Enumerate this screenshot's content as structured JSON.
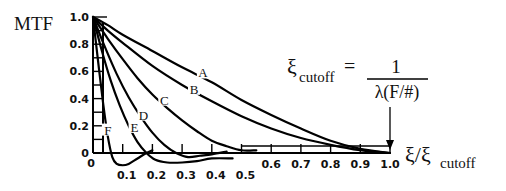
{
  "chart_data": {
    "type": "line",
    "title": "",
    "ylabel": "MTF",
    "xlabel_main": "ξ/ξ",
    "xlabel_sub": "cutoff",
    "xlim": [
      0,
      1.0
    ],
    "ylim": [
      -0.1,
      1.0
    ],
    "grid": false,
    "legend": "inline curve labels",
    "y_ticks": [
      0.2,
      0.4,
      0.6,
      0.8,
      1.0
    ],
    "y_tick_labels": [
      "0.2",
      "0.4",
      "0.6",
      "0.8",
      "1.0"
    ],
    "y_zero_label": "0",
    "x_origin_label": "0",
    "x_ticks_low": [
      0.1,
      0.2,
      0.3,
      0.4,
      0.5
    ],
    "x_tick_labels_low": [
      "0.1",
      "0.2",
      "0.3",
      "0.4",
      "0.5"
    ],
    "x_ticks_high": [
      0.6,
      0.7,
      0.8,
      0.9,
      1.0
    ],
    "x_tick_labels_high": [
      "0.6",
      "0.7",
      "0.8",
      "0.9",
      "1.0"
    ],
    "annotation": {
      "lhs_symbol": "ξ",
      "lhs_sub": "cutoff",
      "equals": "=",
      "numerator": "1",
      "denominator": "λ(F/#)",
      "arrow_target_x": 1.0
    },
    "series": [
      {
        "name": "A",
        "label_at": [
          0.37,
          0.57
        ],
        "x": [
          0,
          0.05,
          0.1,
          0.2,
          0.3,
          0.4,
          0.5,
          0.6,
          0.7,
          0.8,
          0.9,
          1.0
        ],
        "y": [
          1.0,
          0.94,
          0.87,
          0.75,
          0.63,
          0.52,
          0.39,
          0.28,
          0.18,
          0.09,
          0.03,
          0.0
        ]
      },
      {
        "name": "B",
        "label_at": [
          0.34,
          0.45
        ],
        "x": [
          0,
          0.05,
          0.1,
          0.2,
          0.3,
          0.4,
          0.5,
          0.6,
          0.7,
          0.8,
          0.9,
          0.95,
          1.0
        ],
        "y": [
          1.0,
          0.9,
          0.81,
          0.64,
          0.5,
          0.38,
          0.27,
          0.18,
          0.11,
          0.06,
          0.02,
          0.01,
          0.0
        ]
      },
      {
        "name": "C",
        "label_at": [
          0.24,
          0.37
        ],
        "x": [
          0,
          0.05,
          0.1,
          0.15,
          0.2,
          0.25,
          0.3,
          0.35,
          0.4,
          0.45,
          0.5,
          0.55
        ],
        "y": [
          1.0,
          0.84,
          0.69,
          0.55,
          0.43,
          0.33,
          0.24,
          0.16,
          0.09,
          0.05,
          0.02,
          0.02
        ]
      },
      {
        "name": "D",
        "label_at": [
          0.17,
          0.26
        ],
        "x": [
          0,
          0.04,
          0.08,
          0.12,
          0.16,
          0.2,
          0.24,
          0.28,
          0.32,
          0.36,
          0.4,
          0.45
        ],
        "y": [
          1.0,
          0.78,
          0.58,
          0.41,
          0.27,
          0.15,
          0.06,
          0.0,
          -0.03,
          -0.02,
          -0.01,
          0.01
        ]
      },
      {
        "name": "E",
        "label_at": [
          0.14,
          0.17
        ],
        "x": [
          0,
          0.03,
          0.06,
          0.09,
          0.12,
          0.15,
          0.18,
          0.21,
          0.25,
          0.3,
          0.35,
          0.4,
          0.47
        ],
        "y": [
          1.0,
          0.75,
          0.53,
          0.35,
          0.2,
          0.08,
          0.0,
          -0.05,
          -0.07,
          -0.07,
          -0.06,
          -0.04,
          -0.04
        ]
      },
      {
        "name": "F",
        "label_at": [
          0.05,
          0.15
        ],
        "x": [
          0,
          0.02,
          0.035,
          0.05,
          0.065,
          0.08,
          0.1,
          0.12,
          0.15,
          0.18,
          0.2
        ],
        "y": [
          1.0,
          0.62,
          0.35,
          0.12,
          -0.03,
          -0.08,
          -0.09,
          -0.08,
          -0.04,
          0.0,
          0.02
        ]
      }
    ]
  }
}
